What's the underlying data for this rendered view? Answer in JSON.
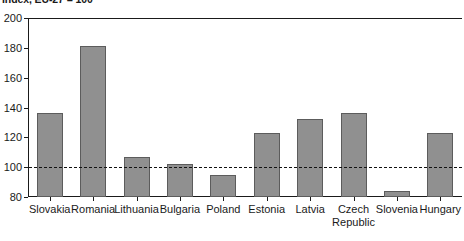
{
  "chart_data": {
    "type": "bar",
    "title": "",
    "subtitle": "Index, EU-27 = 100",
    "xlabel": "",
    "ylabel": "",
    "ylim": [
      80,
      200
    ],
    "yticks": [
      80,
      100,
      120,
      140,
      160,
      180,
      200
    ],
    "grid": false,
    "legend": null,
    "reference_line": {
      "value": 100,
      "style": "dashed",
      "color": "#111111"
    },
    "bar_color": "#909090",
    "bar_edge_color": "#5c5c5c",
    "categories": [
      "Slovakia",
      "Romania",
      "Lithuania",
      "Bulgaria",
      "Poland",
      "Estonia",
      "Latvia",
      "Czech\nRepublic",
      "Slovenia",
      "Hungary"
    ],
    "values": [
      136,
      181,
      107,
      102,
      95,
      123,
      132,
      136,
      84,
      123
    ]
  }
}
